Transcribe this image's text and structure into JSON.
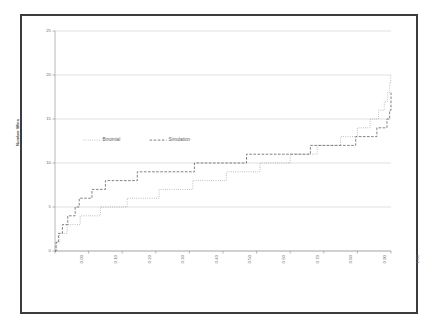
{
  "chart_data": {
    "type": "line",
    "title": "Compare Binomial Distribution with Monte Carlo Simulation",
    "xlabel": "Cumulative Percentage",
    "ylabel": "Number Wins",
    "xlim": [
      0,
      1.0
    ],
    "ylim": [
      0,
      25
    ],
    "grid": true,
    "grid_axis": "y",
    "legend": [
      "Binomial",
      "Simulation"
    ],
    "legend_position": "inside-left-middle",
    "xticks": [
      "0.00",
      "0.10",
      "0.20",
      "0.30",
      "0.40",
      "0.50",
      "0.60",
      "0.70",
      "0.80",
      "0.90",
      "1.00"
    ],
    "xtick_values": [
      0.0,
      0.1,
      0.2,
      0.3,
      0.4,
      0.5,
      0.6,
      0.7,
      0.8,
      0.9,
      1.0
    ],
    "yticks": [
      "0",
      "5",
      "10",
      "15",
      "20",
      "25"
    ],
    "ytick_values": [
      0,
      5,
      10,
      15,
      20,
      25
    ],
    "series": [
      {
        "name": "Binomial",
        "style": "dotted",
        "color": "#8a8a8a",
        "step": "post",
        "x": [
          0.0,
          0.005,
          0.014,
          0.036,
          0.075,
          0.135,
          0.215,
          0.31,
          0.41,
          0.51,
          0.61,
          0.7,
          0.78,
          0.85,
          0.9,
          0.938,
          0.963,
          0.98,
          0.99,
          0.996,
          0.999,
          1.0
        ],
        "y": [
          0,
          1,
          2,
          3,
          4,
          5,
          6,
          7,
          8,
          9,
          10,
          11,
          12,
          13,
          14,
          15,
          16,
          17,
          18,
          19,
          20,
          20
        ]
      },
      {
        "name": "Simulation",
        "style": "dashed",
        "color": "#585858",
        "step": "post",
        "x": [
          0.0,
          0.003,
          0.01,
          0.022,
          0.038,
          0.06,
          0.072,
          0.09,
          0.11,
          0.15,
          0.175,
          0.245,
          0.405,
          0.415,
          0.555,
          0.57,
          0.745,
          0.76,
          0.88,
          0.895,
          0.945,
          0.958,
          0.98,
          0.988,
          0.996,
          1.0
        ],
        "y": [
          0,
          1,
          2,
          3,
          4,
          5,
          6,
          6,
          7,
          8,
          8,
          9,
          9,
          10,
          10,
          11,
          11,
          12,
          12,
          13,
          13,
          14,
          14,
          15,
          16,
          18
        ]
      }
    ]
  }
}
